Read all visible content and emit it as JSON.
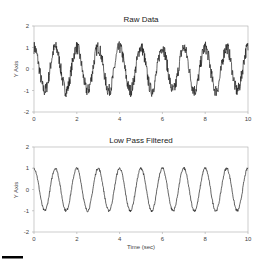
{
  "chart_data": [
    {
      "type": "line",
      "title": "Raw Data",
      "xlabel": "",
      "ylabel": "Y Axis",
      "xlim": [
        0,
        10
      ],
      "ylim": [
        -2,
        2
      ],
      "xticks": [
        "0",
        "2",
        "4",
        "6",
        "8",
        "10"
      ],
      "yticks": [
        "2",
        "1",
        "0",
        "-1",
        "-2"
      ],
      "grid": false,
      "series": [
        {
          "name": "Raw signal",
          "description": "noisy ~1 Hz cosine, amplitude ~1 with high-frequency noise (~±0.3)",
          "frequency_hz": 1,
          "amplitude": 1,
          "noise": 0.3
        }
      ]
    },
    {
      "type": "line",
      "title": "Low Pass Filtered",
      "xlabel": "Time (sec)",
      "ylabel": "Y Axis",
      "xlim": [
        0,
        10
      ],
      "ylim": [
        -2,
        2
      ],
      "xticks": [
        "0",
        "2",
        "4",
        "6",
        "8",
        "10"
      ],
      "yticks": [
        "2",
        "1",
        "0",
        "-1",
        "-2"
      ],
      "grid": false,
      "series": [
        {
          "name": "Filtered signal",
          "description": "smooth ~1 Hz cosine, amplitude ~1",
          "frequency_hz": 1,
          "amplitude": 1,
          "noise": 0.06
        }
      ]
    }
  ],
  "colors": {
    "line": "#222222",
    "axis": "#aaaaaa",
    "bar": "#000000"
  }
}
